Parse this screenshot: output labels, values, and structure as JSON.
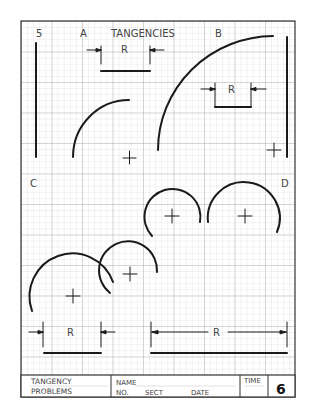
{
  "sheet": {
    "number": "5",
    "title": "TANGENCIES",
    "section_labels": {
      "a": "A",
      "b": "B",
      "c": "C",
      "d": "D"
    },
    "dimension_label": "R"
  },
  "title_block": {
    "problem_title_line1": "TANGENCY",
    "problem_title_line2": "PROBLEMS",
    "name_label": "NAME",
    "no_label": "NO.",
    "sect_label": "SECT",
    "date_label": "DATE",
    "time_label": "TIME",
    "sheet_number": "6"
  },
  "colors": {
    "grid_minor": "#d4d4d4",
    "grid_major": "#a8a8a8",
    "ink": "#1a1a1a",
    "frame": "#333333"
  }
}
